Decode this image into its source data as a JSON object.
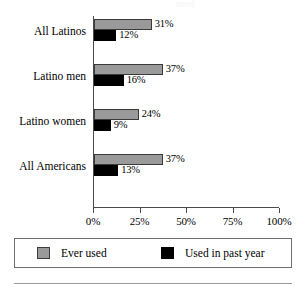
{
  "title_clipped": "used",
  "chart_data": {
    "type": "bar",
    "orientation": "horizontal",
    "title": "",
    "xlabel": "",
    "ylabel": "",
    "xlim": [
      0,
      100
    ],
    "grid": false,
    "legend_position": "bottom",
    "categories": [
      "All Latinos",
      "Latino men",
      "Latino women",
      "All Americans"
    ],
    "tick_labels": [
      "0%",
      "25%",
      "50%",
      "75%",
      "100%"
    ],
    "tick_values": [
      0,
      25,
      50,
      75,
      100
    ],
    "series": [
      {
        "name": "Ever used",
        "color": "#9a9a9a",
        "values": [
          31,
          37,
          24,
          37
        ],
        "value_labels": [
          "31%",
          "37%",
          "24%",
          "37%"
        ]
      },
      {
        "name": "Used in past year",
        "color": "#000000",
        "values": [
          12,
          16,
          9,
          13
        ],
        "value_labels": [
          "12%",
          "16%",
          "9%",
          "13%"
        ]
      }
    ]
  },
  "legend": {
    "items": [
      {
        "label": "Ever used",
        "color": "#9a9a9a"
      },
      {
        "label": "Used in past year",
        "color": "#000000"
      }
    ]
  }
}
